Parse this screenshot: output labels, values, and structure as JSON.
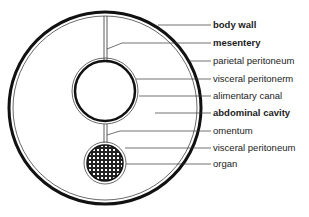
{
  "labels": [
    {
      "text": "body wall",
      "y": 25,
      "bold": true
    },
    {
      "text": "mesentery",
      "y": 43,
      "bold": true
    },
    {
      "text": "parietal peritoneum",
      "y": 61,
      "bold": false
    },
    {
      "text": "visceral peritonerm",
      "y": 79,
      "bold": false
    },
    {
      "text": "alimentary canal",
      "y": 96,
      "bold": false
    },
    {
      "text": "abdominal cavity",
      "y": 113,
      "bold": true
    },
    {
      "text": "omentum",
      "y": 131,
      "bold": false
    },
    {
      "text": "visceral peritoneum",
      "y": 148,
      "bold": false
    },
    {
      "text": "organ",
      "y": 164,
      "bold": false
    }
  ]
}
